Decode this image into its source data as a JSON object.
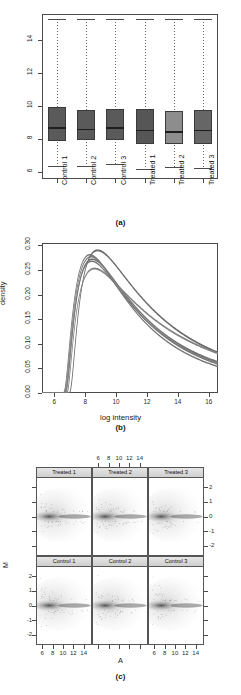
{
  "figure": {
    "panels": [
      {
        "tag": "(a)"
      },
      {
        "tag": "(b)"
      },
      {
        "tag": "(c)"
      }
    ]
  },
  "chart_data": [
    {
      "type": "box",
      "panel": "(a)",
      "title": "",
      "xlabel": "",
      "ylabel": "",
      "ylim": [
        5.6,
        15.6
      ],
      "yticks": [
        6,
        8,
        10,
        12,
        14
      ],
      "grid": false,
      "categories": [
        "Control 1",
        "Control 2",
        "Control 3",
        "Treated 1",
        "Treated 2",
        "Treated 3"
      ],
      "boxes": [
        {
          "label": "Control 1",
          "whisker_low": 6.4,
          "q1": 7.9,
          "median": 8.75,
          "q3": 9.95,
          "whisker_high": 15.3,
          "fill": "#5a5a5a"
        },
        {
          "label": "Control 2",
          "whisker_low": 6.4,
          "q1": 7.95,
          "median": 8.65,
          "q3": 9.8,
          "whisker_high": 15.3,
          "fill": "#5a5a5a"
        },
        {
          "label": "Control 3",
          "whisker_low": 6.5,
          "q1": 7.95,
          "median": 8.75,
          "q3": 9.85,
          "whisker_high": 15.3,
          "fill": "#5a5a5a"
        },
        {
          "label": "Treated 1",
          "whisker_low": 6.2,
          "q1": 7.75,
          "median": 8.6,
          "q3": 9.85,
          "whisker_high": 15.3,
          "fill": "#565656"
        },
        {
          "label": "Treated 2",
          "whisker_low": 6.3,
          "q1": 7.7,
          "median": 8.5,
          "q3": 9.7,
          "whisker_high": 15.3,
          "fill": "#8d8d8d"
        },
        {
          "label": "Treated 3",
          "whisker_low": 6.25,
          "q1": 7.75,
          "median": 8.6,
          "q3": 9.8,
          "whisker_high": 15.3,
          "fill": "#666666"
        }
      ]
    },
    {
      "type": "line",
      "panel": "(b)",
      "title": "",
      "xlabel": "log intensity",
      "ylabel": "density",
      "xlim": [
        5.2,
        16.6
      ],
      "ylim": [
        0.0,
        0.305
      ],
      "xticks": [
        6,
        8,
        10,
        12,
        14,
        16
      ],
      "yticks": [
        "0.00",
        "0.05",
        "0.10",
        "0.15",
        "0.20",
        "0.25",
        "0.30"
      ],
      "grid": false,
      "legend": "none",
      "series": [
        {
          "name": "Control 1",
          "peak_x": 8.45,
          "peak_y": 0.272,
          "rise_x": 6.65,
          "spread": 1.0,
          "color": "#6f6f6f"
        },
        {
          "name": "Control 2",
          "peak_x": 8.3,
          "peak_y": 0.281,
          "rise_x": 6.55,
          "spread": 0.96,
          "color": "#747474"
        },
        {
          "name": "Control 3",
          "peak_x": 8.38,
          "peak_y": 0.277,
          "rise_x": 6.6,
          "spread": 0.98,
          "color": "#7a7a7a"
        },
        {
          "name": "Treated 1",
          "peak_x": 8.8,
          "peak_y": 0.29,
          "rise_x": 6.95,
          "spread": 1.04,
          "color": "#6a6a6a"
        },
        {
          "name": "Treated 2",
          "peak_x": 8.6,
          "peak_y": 0.253,
          "rise_x": 6.8,
          "spread": 1.12,
          "color": "#828282"
        },
        {
          "name": "Treated 3",
          "peak_x": 8.42,
          "peak_y": 0.268,
          "rise_x": 6.7,
          "spread": 1.02,
          "color": "#777777"
        }
      ]
    },
    {
      "type": "scatter",
      "panel": "(c)",
      "title": "",
      "xlabel": "A",
      "ylabel": "M",
      "xlim": [
        4.8,
        15.6
      ],
      "ylim": [
        -2.7,
        2.7
      ],
      "xticks": [
        6,
        8,
        10,
        12,
        14
      ],
      "yticks": [
        2,
        1,
        0,
        -1,
        -2
      ],
      "grid": false,
      "layout": "2 rows x 3 columns",
      "panels": [
        {
          "strip": "Treated 1",
          "row": 0,
          "col": 0
        },
        {
          "strip": "Treated 2",
          "row": 0,
          "col": 1
        },
        {
          "strip": "Treated 3",
          "row": 0,
          "col": 2
        },
        {
          "strip": "Control 1",
          "row": 1,
          "col": 0
        },
        {
          "strip": "Control 2",
          "row": 1,
          "col": 1
        },
        {
          "strip": "Control 3",
          "row": 1,
          "col": 2
        }
      ]
    }
  ]
}
